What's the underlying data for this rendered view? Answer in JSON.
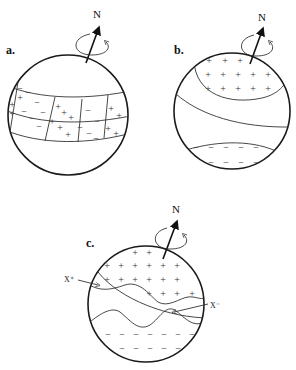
{
  "figure": {
    "panels": [
      {
        "id": "a",
        "label": "a.",
        "axis_label": "N",
        "description": "Sphere with equatorial band divided into cells of alternating + and - signs"
      },
      {
        "id": "b",
        "label": "b.",
        "axis_label": "N",
        "description": "Sphere with + cap in northern region and - band in southern region"
      },
      {
        "id": "c",
        "label": "c.",
        "axis_label": "N",
        "description": "Sphere with + region in north, - region in south, wavy boundaries marked X+ and X-",
        "markers": [
          "X⁺",
          "X⁻"
        ]
      }
    ],
    "signs": {
      "positive": "+",
      "negative": "−"
    }
  }
}
